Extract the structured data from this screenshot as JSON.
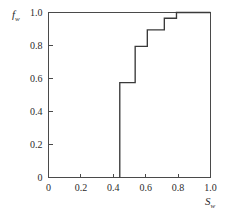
{
  "chart_data": {
    "type": "line",
    "subtype": "step-post",
    "title": "",
    "subtitle": "",
    "xlabel": "S",
    "xlabel_sub": "w",
    "ylabel": "f",
    "ylabel_sub": "w",
    "xlim": [
      0,
      1.0
    ],
    "ylim": [
      0,
      1.0
    ],
    "grid": false,
    "legend": false,
    "legend_position": "none",
    "xticks": [
      0,
      0.2,
      0.4,
      0.6,
      0.8,
      1.0
    ],
    "xtick_labels": [
      "0",
      "0.2",
      "0.4",
      "0.6",
      "0.8",
      "1.0"
    ],
    "yticks": [
      0,
      0.2,
      0.4,
      0.6,
      0.8,
      1.0
    ],
    "ytick_labels": [
      "0",
      "0.2",
      "0.4",
      "0.6",
      "0.8",
      "1.0"
    ],
    "series": [
      {
        "name": "fractional flow",
        "color": "#3a3a3a",
        "x": [
          0.44,
          0.44,
          0.535,
          0.535,
          0.61,
          0.61,
          0.715,
          0.715,
          0.79,
          0.79,
          1.0
        ],
        "y": [
          0.0,
          0.575,
          0.575,
          0.795,
          0.795,
          0.895,
          0.895,
          0.965,
          0.965,
          1.0,
          1.0
        ]
      }
    ],
    "steps": [
      {
        "sw_start": 0.44,
        "sw_end": 0.535,
        "fw": 0.575
      },
      {
        "sw_start": 0.535,
        "sw_end": 0.61,
        "fw": 0.795
      },
      {
        "sw_start": 0.61,
        "sw_end": 0.715,
        "fw": 0.895
      },
      {
        "sw_start": 0.715,
        "sw_end": 0.79,
        "fw": 0.965
      },
      {
        "sw_start": 0.79,
        "sw_end": 1.0,
        "fw": 1.0
      }
    ],
    "axis_color": "#4a4a4a",
    "curve_color": "#3a3a3a",
    "background_color": "#ffffff"
  },
  "figure": {
    "name": "fractional-flow-chart"
  }
}
